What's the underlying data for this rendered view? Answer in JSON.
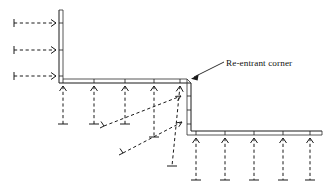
{
  "figure": {
    "type": "engineering-diagram",
    "background_color": "#ffffff",
    "line_color": "#1a1a1a",
    "width": 335,
    "height": 191
  },
  "annotations": {
    "corner_label": "Re-entrant corner",
    "leader_from": [
      224,
      62
    ],
    "leader_to": [
      191,
      78
    ],
    "label_position": [
      226,
      64
    ]
  },
  "geometry": {
    "description": "L-shaped stepped double-line wall profile",
    "wall_thickness": 3,
    "outer_polyline": [
      [
        59,
        10
      ],
      [
        59,
        83
      ],
      [
        191,
        83
      ],
      [
        191,
        131
      ],
      [
        322,
        131
      ]
    ],
    "inner_polyline": [
      [
        63,
        10
      ],
      [
        63,
        79
      ],
      [
        187,
        79
      ],
      [
        187,
        135
      ],
      [
        322,
        135
      ]
    ],
    "reentrant_corner_point": [
      191,
      79
    ]
  },
  "arrows": {
    "incoming_left": {
      "direction": "right",
      "count": 3,
      "items": [
        {
          "tail": [
            14,
            23
          ],
          "head": [
            56,
            23
          ]
        },
        {
          "tail": [
            14,
            50
          ],
          "head": [
            56,
            50
          ]
        },
        {
          "tail": [
            14,
            76
          ],
          "head": [
            56,
            76
          ]
        }
      ]
    },
    "upper_surface_down": {
      "direction": "down",
      "count": 5,
      "items": [
        {
          "head": [
            63,
            84
          ],
          "tail": [
            63,
            124
          ]
        },
        {
          "head": [
            94,
            84
          ],
          "tail": [
            94,
            124
          ]
        },
        {
          "head": [
            125,
            84
          ],
          "tail": [
            125,
            124
          ]
        },
        {
          "head": [
            154,
            84
          ],
          "tail": [
            154,
            137
          ]
        },
        {
          "head": [
            180,
            84
          ],
          "tail": [
            180,
            166
          ]
        }
      ]
    },
    "lower_surface_down": {
      "direction": "down",
      "count": 5,
      "items": [
        {
          "head": [
            196,
            136
          ],
          "tail": [
            196,
            180
          ]
        },
        {
          "head": [
            225,
            136
          ],
          "tail": [
            225,
            180
          ]
        },
        {
          "head": [
            254,
            136
          ],
          "tail": [
            254,
            180
          ]
        },
        {
          "head": [
            283,
            136
          ],
          "tail": [
            283,
            180
          ]
        },
        {
          "head": [
            310,
            136
          ],
          "tail": [
            310,
            180
          ]
        }
      ]
    },
    "diagonal_to_corner": {
      "direction": "up-right",
      "count": 2,
      "items": [
        {
          "tail": [
            104,
            126
          ],
          "head": [
            181,
            96
          ]
        },
        {
          "tail": [
            123,
            153
          ],
          "head": [
            182,
            122
          ]
        }
      ]
    }
  },
  "surface_ticks": {
    "upper": [
      63,
      94,
      125,
      154,
      180
    ],
    "lower": [
      196,
      225,
      254,
      283,
      310
    ],
    "vertical_wall": [
      96,
      110,
      124
    ],
    "left_wall": [
      23,
      50,
      76
    ]
  }
}
